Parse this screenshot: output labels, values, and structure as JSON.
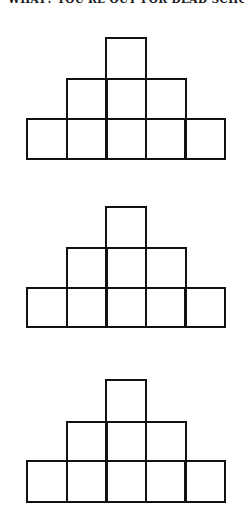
{
  "header": {
    "text": "WHAT? YOU'RE OUT FOR DEAD SCHOOL"
  },
  "style": {
    "line_color": "#111111",
    "background": "#ffffff"
  },
  "figures": [
    {
      "name": "pyramid-1",
      "rows": [
        1,
        3,
        5
      ],
      "top": 37,
      "row_tops": [
        37,
        78,
        118
      ],
      "bottom": 160
    },
    {
      "name": "pyramid-2",
      "rows": [
        1,
        3,
        5
      ],
      "top": 206,
      "row_tops": [
        206,
        247,
        287
      ],
      "bottom": 328
    },
    {
      "name": "pyramid-3",
      "rows": [
        1,
        3,
        5
      ],
      "top": 379,
      "row_tops": [
        379,
        421,
        460
      ],
      "bottom": 503
    }
  ]
}
